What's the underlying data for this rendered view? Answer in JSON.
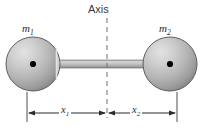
{
  "figure": {
    "title_text": "Axis",
    "width": 204,
    "height": 132,
    "background_color": "#ffffff"
  },
  "labels": {
    "mass_left": "m",
    "mass_left_sub": "1",
    "mass_right": "m",
    "mass_right_sub": "2",
    "axis": "Axis",
    "distance_left": "x",
    "distance_left_sub": "1",
    "distance_right": "x",
    "distance_right_sub": "2"
  },
  "colors": {
    "sphere_light": "#d8d8d8",
    "sphere_mid": "#b4b4b4",
    "sphere_dark": "#8a8a8a",
    "sphere_outline": "#5a5a5a",
    "rod_light": "#cfcfcf",
    "rod_dark": "#9a9a9a",
    "line": "#2b2b2b",
    "dash": "#6f6f6f",
    "center_dot": "#000000",
    "text": "#2b2b2b"
  },
  "geometry": {
    "sphere_left_center_x": 33,
    "sphere_left_center_y": 64,
    "sphere_right_center_x": 170,
    "sphere_right_center_y": 64,
    "sphere_radius": 27,
    "rod_y": 64,
    "axis_x": 107,
    "axis_top_y": 18,
    "axis_bottom_y": 118,
    "dim_line_y": 113,
    "tick_left_x": 27,
    "tick_center_x": 107,
    "tick_right_x": 177
  }
}
